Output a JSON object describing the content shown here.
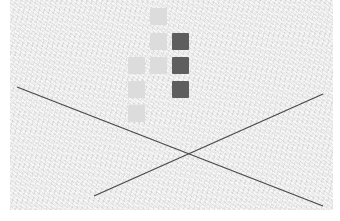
{
  "canvas": {
    "width": 340,
    "height": 221,
    "background": "#ffffff",
    "paper_color": "#eeeeee"
  },
  "colors": {
    "light_tile": "#dcdcdc",
    "dark_tile": "#5e5e5e",
    "line": "#4a4a4a"
  },
  "tiles": [
    {
      "x": 150,
      "y": 8,
      "shade": "light"
    },
    {
      "x": 150,
      "y": 33,
      "shade": "light"
    },
    {
      "x": 172,
      "y": 33,
      "shade": "dark"
    },
    {
      "x": 128,
      "y": 57,
      "shade": "light"
    },
    {
      "x": 150,
      "y": 57,
      "shade": "light"
    },
    {
      "x": 172,
      "y": 57,
      "shade": "dark"
    },
    {
      "x": 128,
      "y": 81,
      "shade": "light"
    },
    {
      "x": 172,
      "y": 81,
      "shade": "dark"
    },
    {
      "x": 128,
      "y": 105,
      "shade": "light"
    }
  ],
  "lines": [
    {
      "x1": 17,
      "y1": 87,
      "x2": 323,
      "y2": 206
    },
    {
      "x1": 94,
      "y1": 196,
      "x2": 323,
      "y2": 94
    }
  ]
}
